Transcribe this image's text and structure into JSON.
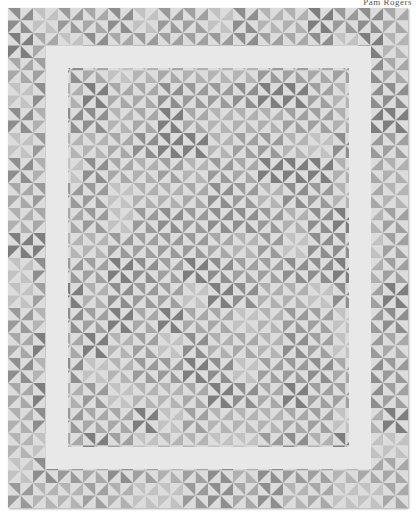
{
  "caption": {
    "text": "Pam Rogers"
  },
  "photo": {
    "subject": "pinwheel-quilt",
    "width": 400,
    "height": 500,
    "block_size": 25,
    "cols": 16,
    "rows": 20,
    "background_color": "#e4e4e4",
    "sashing": {
      "color": "#e8e8e8",
      "outer": {
        "x": 38,
        "y": 38,
        "w": 325,
        "h": 423
      },
      "thickness": 22
    },
    "palette": [
      "#9a9a9a",
      "#a8a8a8",
      "#b4b4b4",
      "#8e8e8e",
      "#c2c2c2",
      "#7e7e7e",
      "#b0b0b0",
      "#a0a0a0"
    ],
    "light_color": "#dcdcdc"
  }
}
